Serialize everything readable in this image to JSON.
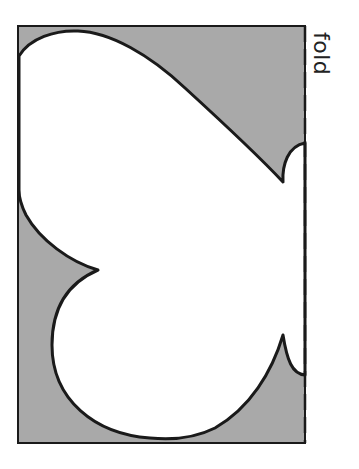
{
  "diagram": {
    "fold_label": "fold",
    "colors": {
      "background_fill": "#a9a9a9",
      "shape_fill": "#ffffff",
      "outline": "#1a1a1a"
    },
    "elements": [
      {
        "name": "paper-rectangle",
        "description": "gray rectangle representing folded paper"
      },
      {
        "name": "butterfly-half-shape",
        "description": "white half-butterfly outline to cut out"
      },
      {
        "name": "fold-line",
        "description": "dashed line along right edge marking fold"
      },
      {
        "name": "upper-antenna",
        "description": "notch near top of fold edge"
      },
      {
        "name": "lower-antenna",
        "description": "notch near bottom of fold edge"
      }
    ]
  }
}
